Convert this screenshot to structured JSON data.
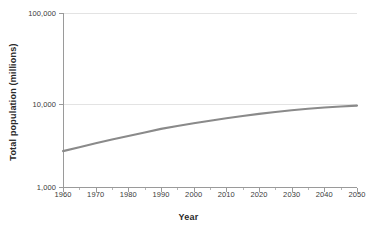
{
  "chart_data": {
    "type": "line",
    "title": "",
    "xlabel": "Year",
    "ylabel": "Total population (millions)",
    "x_ticks": [
      "1960",
      "1970",
      "1980",
      "1990",
      "2000",
      "2010",
      "2020",
      "2030",
      "2040",
      "2050"
    ],
    "x_tick_values": [
      1960,
      1970,
      1980,
      1990,
      2000,
      2010,
      2020,
      2030,
      2040,
      2050
    ],
    "x_minor_tick_values": [
      1965,
      1975,
      1985,
      1995,
      2005,
      2015,
      2025,
      2035,
      2045
    ],
    "xlim": [
      1960,
      2050
    ],
    "y_ticks": [
      "1,000",
      "10,000",
      "100,000"
    ],
    "y_tick_values": [
      1000,
      10000,
      100000
    ],
    "ylim": [
      1000,
      100000
    ],
    "yscale": "log",
    "grid": "horizontal-only",
    "legend": "none",
    "series": [
      {
        "name": "Total population",
        "color": "#8a8a8a",
        "x": [
          1960,
          1965,
          1970,
          1975,
          1980,
          1985,
          1990,
          1995,
          2000,
          2005,
          2010,
          2015,
          2020,
          2025,
          2030,
          2035,
          2040,
          2045,
          2050
        ],
        "values": [
          3035,
          3340,
          3700,
          4080,
          4450,
          4870,
          5330,
          5740,
          6145,
          6540,
          6960,
          7380,
          7795,
          8185,
          8550,
          8870,
          9160,
          9400,
          9600
        ]
      }
    ]
  },
  "axis_titles": {
    "x": "Year",
    "y": "Total population (millions)"
  },
  "colors": {
    "series": "#8a8a8a",
    "grid": "#e3e3e3",
    "axis": "#9a9a9a",
    "text": "#3a3a3a",
    "background": "#ffffff"
  }
}
